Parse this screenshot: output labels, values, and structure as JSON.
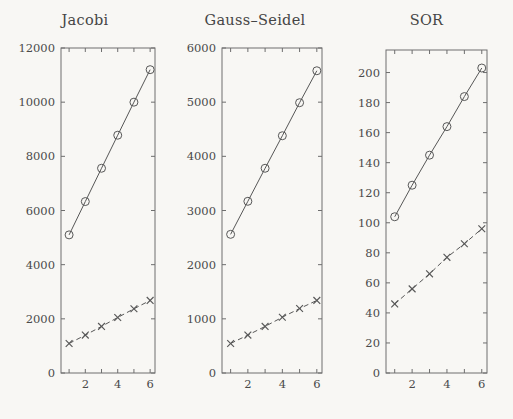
{
  "figure": {
    "background_color": "#f8f7f4",
    "line_color": "#575757",
    "axis_color": "#6e6e6e",
    "panel_count": 3
  },
  "chart_data": [
    {
      "type": "line",
      "title": "Jacobi",
      "xlabel": "",
      "ylabel": "",
      "x": [
        1,
        2,
        3,
        4,
        5,
        6
      ],
      "xlim": [
        0.5,
        6.3
      ],
      "ylim": [
        0,
        12000
      ],
      "xticks": [
        1,
        2,
        3,
        4,
        5,
        6
      ],
      "xticklabels": [
        "",
        "2",
        "",
        "4",
        "",
        "6"
      ],
      "yticks": [
        0,
        2000,
        4000,
        6000,
        8000,
        10000,
        12000
      ],
      "yticklabels": [
        "0",
        "2000",
        "4000",
        "6000",
        "8000",
        "10000",
        "12000"
      ],
      "grid": false,
      "legend": "none",
      "series": [
        {
          "name": "circle-solid",
          "marker": "circle",
          "linestyle": "solid",
          "values": [
            5100,
            6330,
            7560,
            8780,
            10000,
            11200
          ]
        },
        {
          "name": "cross-dashed",
          "marker": "x",
          "linestyle": "dashed",
          "values": [
            1090,
            1400,
            1720,
            2050,
            2370,
            2680
          ]
        }
      ]
    },
    {
      "type": "line",
      "title": "Gauss–Seidel",
      "xlabel": "",
      "ylabel": "",
      "x": [
        1,
        2,
        3,
        4,
        5,
        6
      ],
      "xlim": [
        0.5,
        6.3
      ],
      "ylim": [
        0,
        6000
      ],
      "xticks": [
        1,
        2,
        3,
        4,
        5,
        6
      ],
      "xticklabels": [
        "",
        "2",
        "",
        "4",
        "",
        "6"
      ],
      "yticks": [
        0,
        1000,
        2000,
        3000,
        4000,
        5000,
        6000
      ],
      "yticklabels": [
        "0",
        "1000",
        "2000",
        "3000",
        "4000",
        "5000",
        "6000"
      ],
      "grid": false,
      "legend": "none",
      "series": [
        {
          "name": "circle-solid",
          "marker": "circle",
          "linestyle": "solid",
          "values": [
            2560,
            3170,
            3780,
            4380,
            4990,
            5580
          ]
        },
        {
          "name": "cross-dashed",
          "marker": "x",
          "linestyle": "dashed",
          "values": [
            545,
            700,
            860,
            1030,
            1190,
            1340
          ]
        }
      ]
    },
    {
      "type": "line",
      "title": "SOR",
      "xlabel": "",
      "ylabel": "",
      "x": [
        1,
        2,
        3,
        4,
        5,
        6
      ],
      "xlim": [
        0.5,
        6.3
      ],
      "ylim": [
        0,
        215
      ],
      "xticks": [
        1,
        2,
        3,
        4,
        5,
        6
      ],
      "xticklabels": [
        "",
        "2",
        "",
        "4",
        "",
        "6"
      ],
      "yticks": [
        0,
        20,
        40,
        60,
        80,
        100,
        120,
        140,
        160,
        180,
        200
      ],
      "yticklabels": [
        "0",
        "20",
        "40",
        "60",
        "80",
        "100",
        "120",
        "140",
        "160",
        "180",
        "200"
      ],
      "grid": false,
      "legend": "none",
      "series": [
        {
          "name": "circle-solid",
          "marker": "circle",
          "linestyle": "solid",
          "values": [
            104,
            125,
            145,
            164,
            184,
            203
          ]
        },
        {
          "name": "cross-dashed",
          "marker": "x",
          "linestyle": "dashed",
          "values": [
            46,
            56,
            66,
            77,
            86,
            96
          ]
        }
      ]
    }
  ],
  "panels": [
    {
      "title": "Jacobi",
      "left": 0,
      "width": 170,
      "plot_x0": 61,
      "plot_x1": 155,
      "plot_y0": 48,
      "plot_y1": 373
    },
    {
      "title": "Gauss–Seidel",
      "left": 170,
      "width": 170,
      "plot_x0": 52,
      "plot_x1": 152,
      "plot_y0": 48,
      "plot_y1": 373
    },
    {
      "title": "SOR",
      "left": 340,
      "width": 173,
      "plot_x0": 46,
      "plot_x1": 147,
      "plot_y0": 50,
      "plot_y1": 373
    }
  ]
}
